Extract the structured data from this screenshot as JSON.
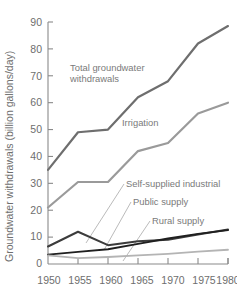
{
  "chart_data": {
    "type": "line",
    "title": "",
    "xlabel": "",
    "ylabel": "Groundwater withdrawals (billion gallons/day)",
    "x": [
      1950,
      1955,
      1960,
      1965,
      1970,
      1975,
      1980
    ],
    "xticklabels": [
      "1950",
      "1955",
      "1960",
      "1965",
      "1970",
      "1975",
      "1980"
    ],
    "yticklabels": [
      "0",
      "10",
      "20",
      "30",
      "40",
      "50",
      "60",
      "70",
      "80",
      "90"
    ],
    "yticks": [
      0,
      10,
      20,
      30,
      40,
      50,
      60,
      70,
      80,
      90
    ],
    "xlim": [
      1950,
      1980
    ],
    "ylim": [
      0,
      90
    ],
    "grid": false,
    "legend": "inline-annotations",
    "series": [
      {
        "name": "Total groundwater withdrawals",
        "color": "#6e6e6e",
        "width": 2.2,
        "values": [
          35,
          49,
          50,
          62,
          68,
          82,
          88.5
        ]
      },
      {
        "name": "Irrigation",
        "color": "#9a9a9a",
        "width": 2.2,
        "values": [
          21,
          30.5,
          30.5,
          42,
          45,
          56,
          60
        ]
      },
      {
        "name": "Self-supplied industrial",
        "color": "#3c3c3c",
        "width": 2.0,
        "values": [
          6.5,
          12,
          7,
          8.5,
          9,
          11,
          12.8
        ]
      },
      {
        "name": "Public supply",
        "color": "#1f1f1f",
        "width": 1.9,
        "values": [
          3.5,
          4.5,
          5.5,
          7.5,
          9.5,
          11.2,
          12.6
        ]
      },
      {
        "name": "Rural supply",
        "color": "#b4b4b4",
        "width": 1.8,
        "values": [
          3.2,
          2.2,
          2.6,
          3.2,
          3.8,
          4.6,
          5.3
        ]
      }
    ],
    "annotations": [
      {
        "id": "total",
        "lines": [
          "Total groundwater",
          "withdrawals"
        ],
        "x": 70,
        "y": 71
      },
      {
        "id": "irrigation",
        "lines": [
          "Irrigation"
        ],
        "x": 122,
        "y": 126
      },
      {
        "id": "self-supplied-industrial",
        "lines": [
          "Self-supplied industrial"
        ],
        "x": 126,
        "y": 187
      },
      {
        "id": "public-supply",
        "lines": [
          "Public supply"
        ],
        "x": 133,
        "y": 205
      },
      {
        "id": "rural-supply",
        "lines": [
          "Rural supply"
        ],
        "x": 152,
        "y": 224
      }
    ]
  },
  "axis": {
    "y_label": "Groundwater withdrawals (billion gallons/day)",
    "y_ticks": [
      "90",
      "80",
      "70",
      "60",
      "50",
      "40",
      "30",
      "20",
      "10",
      "0"
    ],
    "x_ticks": [
      "1950",
      "1955",
      "1960",
      "1965",
      "1970",
      "1975",
      "1980"
    ]
  },
  "labels": {
    "total_line1": "Total groundwater",
    "total_line2": "withdrawals",
    "irrigation": "Irrigation",
    "self_supplied_industrial": "Self-supplied industrial",
    "public_supply": "Public supply",
    "rural_supply": "Rural supply"
  },
  "colors": {
    "total": "#6e6e6e",
    "irrigation": "#9a9a9a",
    "self_supplied_industrial": "#3c3c3c",
    "public_supply": "#1f1f1f",
    "rural_supply": "#b4b4b4",
    "axis": "#8a8a8a",
    "text": "#6e6e6e",
    "background": "#ffffff"
  }
}
